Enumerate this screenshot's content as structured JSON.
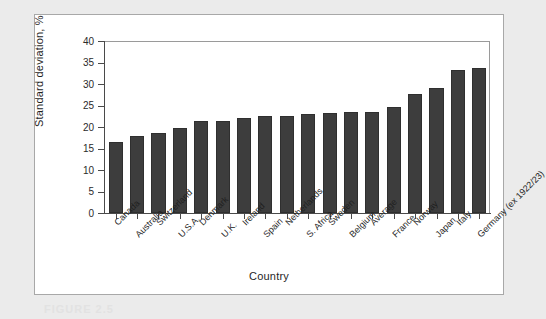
{
  "chart_data": {
    "type": "bar",
    "title": "",
    "xlabel": "Country",
    "ylabel": "Standard deviation, %",
    "ylim": [
      0,
      40
    ],
    "ytick_step": 5,
    "yticks": [
      "0",
      "5",
      "10",
      "15",
      "20",
      "25",
      "30",
      "35",
      "40"
    ],
    "grid": false,
    "legend": null,
    "bar_color": "#3d3d3d",
    "categories": [
      "Canada",
      "Australia",
      "Switzerland",
      "U.S.A.",
      "Denmark",
      "U.K.",
      "Ireland",
      "Spain",
      "Netherlands",
      "S. Africa",
      "Sweden",
      "Belgium",
      "Average",
      "France",
      "Norway",
      "Japan",
      "Italy",
      "Germany (ex 1922/23)"
    ],
    "values": [
      16.5,
      17.8,
      18.7,
      19.7,
      21.3,
      21.5,
      22.1,
      22.5,
      22.5,
      23.1,
      23.3,
      23.4,
      23.6,
      24.7,
      27.6,
      29.0,
      33.3,
      33.8
    ]
  },
  "caption": {
    "partial_text": "FIGURE 2.5"
  }
}
